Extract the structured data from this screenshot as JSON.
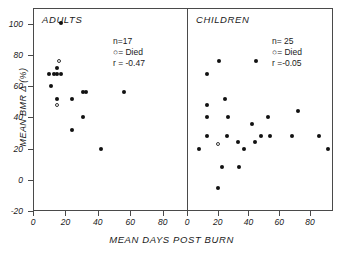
{
  "figure": {
    "xlabel": "MEAN DAYS POST BURN",
    "ylabel": "MEAN BMR Δ (%)"
  },
  "panels": {
    "adults": {
      "title": "ADULTS",
      "n_label": "n=17",
      "died_label": "○= Died",
      "r_label": "r = -0.47"
    },
    "children": {
      "title": "CHILDREN",
      "n_label": "n= 25",
      "died_label": "○= Died",
      "r_label": "r =-0.05"
    }
  },
  "axes": {
    "y_ticks": [
      "100",
      "80",
      "60",
      "40",
      "20",
      "0",
      "-20"
    ],
    "x_ticks_adults": [
      "0",
      "20",
      "40",
      "60",
      "80"
    ],
    "x_ticks_children": [
      "0",
      "20",
      "40",
      "60",
      "80"
    ]
  },
  "chart_data": {
    "type": "scatter",
    "title": "",
    "xlabel": "MEAN DAYS POST BURN",
    "ylabel": "MEAN BMR Δ (%)",
    "ylim": [
      -20,
      110
    ],
    "xlim": [
      0,
      95
    ],
    "grid": false,
    "legend_position": "inside-upper-right of each panel",
    "panels": [
      {
        "name": "ADULTS",
        "n": 17,
        "r": -0.47,
        "series": [
          {
            "name": "Survived",
            "marker": "filled-circle",
            "points": [
              [
                17,
                100.5
              ],
              [
                10,
                67.5
              ],
              [
                13,
                67.5
              ],
              [
                15,
                67.5
              ],
              [
                17,
                67.5
              ],
              [
                15,
                71.5
              ],
              [
                11,
                60.0
              ],
              [
                15,
                52.0
              ],
              [
                24,
                52.0
              ],
              [
                31,
                56.0
              ],
              [
                33,
                56.0
              ],
              [
                56,
                56.0
              ],
              [
                31,
                40.5
              ],
              [
                24,
                32.0
              ],
              [
                42,
                20.0
              ]
            ]
          },
          {
            "name": "Died",
            "marker": "open-circle",
            "points": [
              [
                16,
                76.0
              ],
              [
                15,
                48.0
              ]
            ]
          }
        ]
      },
      {
        "name": "CHILDREN",
        "n": 25,
        "r": -0.05,
        "series": [
          {
            "name": "Survived",
            "marker": "filled-circle",
            "points": [
              [
                21,
                76.0
              ],
              [
                45,
                76.0
              ],
              [
                13,
                68.0
              ],
              [
                25,
                52.0
              ],
              [
                13,
                48.0
              ],
              [
                13,
                40.0
              ],
              [
                27,
                40.0
              ],
              [
                53,
                40.0
              ],
              [
                72,
                44.0
              ],
              [
                42,
                36.0
              ],
              [
                13,
                28.0
              ],
              [
                26,
                28.0
              ],
              [
                48,
                28.0
              ],
              [
                54,
                28.0
              ],
              [
                68,
                28.0
              ],
              [
                86,
                28.0
              ],
              [
                8,
                20.0
              ],
              [
                33,
                24.0
              ],
              [
                44,
                24.0
              ],
              [
                37,
                20.0
              ],
              [
                92,
                20.0
              ],
              [
                23,
                8.0
              ],
              [
                34,
                8.0
              ],
              [
                20,
                -5.0
              ]
            ]
          },
          {
            "name": "Died",
            "marker": "open-circle",
            "points": [
              [
                20,
                23.0
              ]
            ]
          }
        ]
      }
    ]
  }
}
